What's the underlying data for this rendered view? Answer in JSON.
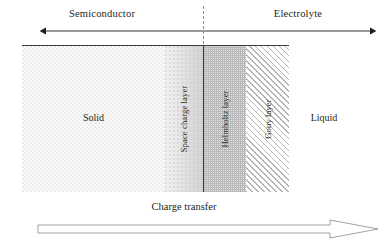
{
  "figure": {
    "title_top_left": "Semiconductor",
    "title_top_right": "Electrolyte",
    "regions": [
      {
        "key": "solid",
        "label": "Solid",
        "orientation": "horizontal"
      },
      {
        "key": "space_charge",
        "label": "Space charge layer",
        "orientation": "vertical"
      },
      {
        "key": "helmholtz",
        "label": "Helmholtz layer",
        "orientation": "vertical"
      },
      {
        "key": "gouy",
        "label": "Gouy layer",
        "orientation": "vertical"
      },
      {
        "key": "liquid",
        "label": "Liquid",
        "orientation": "horizontal"
      }
    ],
    "bottom_arrow_label": "Charge transfer",
    "colors": {
      "line": "#3c3c3c",
      "dashed_divider": "#8d8d8d",
      "text": "#231f20",
      "solid_fill": "#fbfbfb",
      "space_charge_fill": "#e6e6e6",
      "helmholtz_fill": "#cfcfcf",
      "gouy_hatch": "#b5b5b5",
      "arrow_stroke": "#8a8a8a"
    }
  }
}
